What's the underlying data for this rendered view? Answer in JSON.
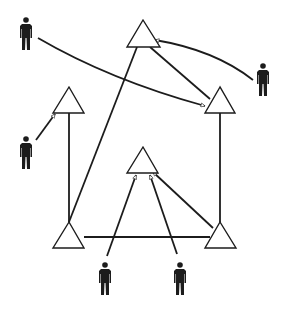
{
  "diagram": {
    "type": "network",
    "colors": {
      "stroke": "#1c1c1c",
      "fill": "#ffffff",
      "background": "#ffffff"
    },
    "nodes": [
      {
        "id": "t-top",
        "shape": "triangle",
        "cx": 143,
        "apex_y": 20,
        "base_y": 47,
        "half_w": 16
      },
      {
        "id": "t-left",
        "shape": "triangle",
        "cx": 69,
        "apex_y": 87,
        "base_y": 113,
        "half_w": 16
      },
      {
        "id": "t-right",
        "shape": "triangle",
        "cx": 220,
        "apex_y": 87,
        "base_y": 113,
        "half_w": 15
      },
      {
        "id": "t-center",
        "shape": "triangle",
        "cx": 143,
        "apex_y": 147,
        "base_y": 173,
        "half_w": 16
      },
      {
        "id": "t-bottom-left",
        "shape": "triangle",
        "cx": 69,
        "apex_y": 222,
        "base_y": 248,
        "half_w": 16
      },
      {
        "id": "t-bottom-right",
        "shape": "triangle",
        "cx": 220,
        "apex_y": 222,
        "base_y": 248,
        "half_w": 16
      }
    ],
    "people": [
      {
        "id": "p-top-left",
        "x": 26,
        "y": 18
      },
      {
        "id": "p-right",
        "x": 263,
        "y": 63
      },
      {
        "id": "p-left",
        "x": 26,
        "y": 136
      },
      {
        "id": "p-bottom-left",
        "x": 105,
        "y": 263
      },
      {
        "id": "p-bottom-right",
        "x": 180,
        "y": 263
      }
    ],
    "edges": [
      {
        "from": "t-bottom-left",
        "to": "t-left",
        "kind": "line"
      },
      {
        "from": "t-bottom-left",
        "to": "t-top",
        "kind": "line"
      },
      {
        "from": "t-bottom-left",
        "to": "t-bottom-right",
        "kind": "line"
      },
      {
        "from": "t-bottom-right",
        "to": "t-right",
        "kind": "line"
      },
      {
        "from": "t-bottom-right",
        "to": "t-center",
        "kind": "arrow"
      },
      {
        "from": "t-top",
        "to": "t-right",
        "kind": "line"
      },
      {
        "from": "p-top-left",
        "to": "t-right",
        "kind": "arrow"
      },
      {
        "from": "p-right",
        "to": "t-top",
        "kind": "arrow"
      },
      {
        "from": "p-left",
        "to": "t-left",
        "kind": "arrow"
      },
      {
        "from": "p-bottom-left",
        "to": "t-center",
        "kind": "arrow"
      },
      {
        "from": "p-bottom-right",
        "to": "t-center",
        "kind": "arrow"
      }
    ]
  }
}
